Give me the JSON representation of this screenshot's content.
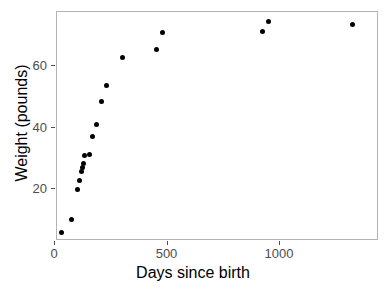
{
  "chart_data": {
    "type": "scatter",
    "title": "",
    "xlabel": "Days since birth",
    "ylabel": "Weight (pounds)",
    "xlim": [
      0,
      1380
    ],
    "ylim": [
      4,
      78
    ],
    "xticks": [
      0,
      500,
      1000
    ],
    "xticklabels": [
      "0",
      "500",
      "1000"
    ],
    "yticks": [
      20,
      40,
      60
    ],
    "yticklabels": [
      "20",
      "40",
      "60"
    ],
    "grid": false,
    "legend": null,
    "marker": "filled-circle",
    "marker_color": "#000000",
    "panel_border_color": "#b4b4b4",
    "x": [
      28,
      73,
      98,
      107,
      116,
      121,
      126,
      131,
      152,
      167,
      183,
      205,
      228,
      300,
      452,
      478,
      920,
      948,
      1320
    ],
    "y": [
      6.0,
      10.2,
      20.0,
      22.8,
      25.6,
      27.0,
      28.4,
      31.0,
      31.3,
      37.2,
      41.0,
      48.6,
      53.8,
      62.8,
      65.4,
      71.0,
      71.2,
      74.6,
      73.6
    ],
    "points": [
      {
        "x": 28,
        "y": 6.0
      },
      {
        "x": 73,
        "y": 10.2
      },
      {
        "x": 98,
        "y": 20.0
      },
      {
        "x": 107,
        "y": 22.8
      },
      {
        "x": 116,
        "y": 25.6
      },
      {
        "x": 121,
        "y": 27.0
      },
      {
        "x": 126,
        "y": 28.4
      },
      {
        "x": 131,
        "y": 31.0
      },
      {
        "x": 152,
        "y": 31.3
      },
      {
        "x": 167,
        "y": 37.2
      },
      {
        "x": 183,
        "y": 41.0
      },
      {
        "x": 205,
        "y": 48.6
      },
      {
        "x": 228,
        "y": 53.8
      },
      {
        "x": 300,
        "y": 62.8
      },
      {
        "x": 452,
        "y": 65.4
      },
      {
        "x": 478,
        "y": 71.0
      },
      {
        "x": 920,
        "y": 71.2
      },
      {
        "x": 948,
        "y": 74.6
      },
      {
        "x": 1320,
        "y": 73.6
      }
    ]
  }
}
